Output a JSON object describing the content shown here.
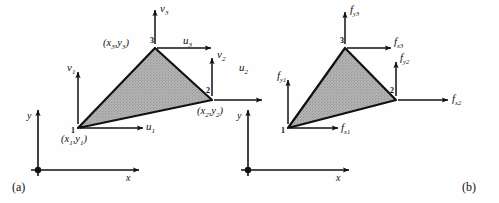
{
  "figure": {
    "panels": [
      {
        "caption": "(a)",
        "description": "Nodal displacement degrees of freedom of a constant-strain triangle element",
        "axes": {
          "x_label": "x",
          "y_label": "y",
          "origin_marker": "filled-dot"
        },
        "element": {
          "shape": "triangle",
          "fill": "stippled-gray",
          "fill_color": "#a8a8a8",
          "edge_color": "#111111"
        },
        "nodes": [
          {
            "number": "1",
            "coord_label": "(x₁,y₁)",
            "coord_base": "(x",
            "coord_sub1": "1",
            "coord_mid": ",y",
            "coord_sub2": "1",
            "coord_end": ")",
            "dofs": [
              {
                "symbol": "u",
                "subscript": "1",
                "direction": "right"
              },
              {
                "symbol": "v",
                "subscript": "1",
                "direction": "up"
              }
            ]
          },
          {
            "number": "2",
            "coord_label": "(x₂,y₂)",
            "coord_base": "(x",
            "coord_sub1": "2",
            "coord_mid": ",y",
            "coord_sub2": "2",
            "coord_end": ")",
            "dofs": [
              {
                "symbol": "u",
                "subscript": "2",
                "direction": "right"
              },
              {
                "symbol": "v",
                "subscript": "2",
                "direction": "up"
              }
            ]
          },
          {
            "number": "3",
            "coord_label": "(x₃,y₃)",
            "coord_base": "(x",
            "coord_sub1": "3",
            "coord_mid": ",y",
            "coord_sub2": "3",
            "coord_end": ")",
            "dofs": [
              {
                "symbol": "u",
                "subscript": "3",
                "direction": "right"
              },
              {
                "symbol": "v",
                "subscript": "3",
                "direction": "up"
              }
            ]
          }
        ]
      },
      {
        "caption": "(b)",
        "description": "Nodal force components of a constant-strain triangle element",
        "axes": {
          "x_label": "x",
          "y_label": "y",
          "origin_marker": "filled-dot"
        },
        "element": {
          "shape": "triangle",
          "fill": "stippled-gray",
          "fill_color": "#a8a8a8",
          "edge_color": "#111111"
        },
        "nodes": [
          {
            "number": "1",
            "forces": [
              {
                "symbol": "f",
                "subscript": "x1",
                "direction": "right"
              },
              {
                "symbol": "f",
                "subscript": "y1",
                "direction": "up"
              }
            ]
          },
          {
            "number": "2",
            "forces": [
              {
                "symbol": "f",
                "subscript": "x2",
                "direction": "right"
              },
              {
                "symbol": "f",
                "subscript": "y2",
                "direction": "up"
              }
            ]
          },
          {
            "number": "3",
            "forces": [
              {
                "symbol": "f",
                "subscript": "x3",
                "direction": "right"
              },
              {
                "symbol": "f",
                "subscript": "y3",
                "direction": "up"
              }
            ]
          }
        ]
      }
    ]
  },
  "labels": {
    "a": {
      "u1": "u",
      "u1s": "1",
      "v1": "v",
      "v1s": "1",
      "u2": "u",
      "u2s": "2",
      "v2": "v",
      "v2s": "2",
      "u3": "u",
      "u3s": "3",
      "v3": "v",
      "v3s": "3",
      "n1": "1",
      "n2": "2",
      "n3": "3",
      "axis_x": "x",
      "axis_y": "y",
      "caption": "(a)"
    },
    "b": {
      "fx1": "f",
      "fx1s": "x1",
      "fy1": "f",
      "fy1s": "y1",
      "fx2": "f",
      "fx2s": "x2",
      "fy2": "f",
      "fy2s": "y2",
      "fx3": "f",
      "fx3s": "x3",
      "fy3": "f",
      "fy3s": "y3",
      "n1": "1",
      "n2": "2",
      "n3": "3",
      "axis_x": "x",
      "axis_y": "y",
      "caption": "(b)"
    }
  }
}
